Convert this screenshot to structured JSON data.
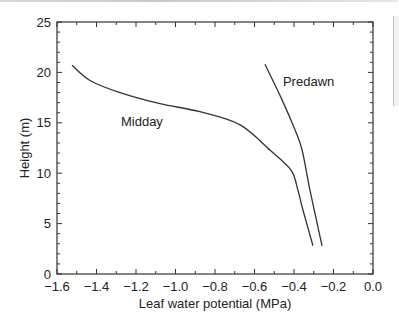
{
  "chart_data": {
    "type": "line",
    "title": "",
    "xlabel": "Leaf water potential (MPa)",
    "ylabel": "Height (m)",
    "xlim": [
      -1.6,
      0.0
    ],
    "ylim": [
      0,
      25
    ],
    "xticks": [
      -1.6,
      -1.4,
      -1.2,
      -1.0,
      -0.8,
      -0.6,
      -0.4,
      -0.2,
      0.0
    ],
    "xtick_labels": [
      "−1.6",
      "−1.4",
      "−1.2",
      "−1.0",
      "−0.8",
      "−0.6",
      "−0.4",
      "−0.2",
      "0.0"
    ],
    "yticks": [
      0,
      5,
      10,
      15,
      20,
      25
    ],
    "ytick_labels": [
      "0",
      "5",
      "10",
      "15",
      "20",
      "25"
    ],
    "grid": false,
    "legend": "none (inline labels)",
    "series": [
      {
        "name": "Midday",
        "label_pos": [
          -1.17,
          15.2
        ],
        "x": [
          -1.524,
          -1.433,
          -1.281,
          -1.078,
          -0.876,
          -0.673,
          -0.522,
          -0.415,
          -0.38,
          -0.354,
          -0.304
        ],
        "y": [
          20.7,
          19.2,
          18.0,
          16.9,
          16.1,
          14.8,
          12.3,
          10.3,
          8.3,
          6.3,
          2.8
        ]
      },
      {
        "name": "Predawn",
        "label_pos": [
          -0.326,
          19.1
        ],
        "x": [
          -0.547,
          -0.461,
          -0.395,
          -0.359,
          -0.319,
          -0.258
        ],
        "y": [
          20.8,
          17.3,
          14.3,
          12.3,
          8.3,
          2.8
        ]
      }
    ]
  },
  "colors": {
    "line": "#333333",
    "axis": "#333333",
    "text": "#222222"
  }
}
